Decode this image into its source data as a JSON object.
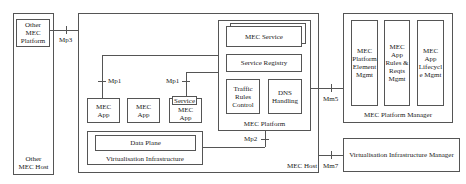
{
  "diagram": {
    "other_host": {
      "label": "Other MEC Host",
      "line1": "Other",
      "line2": "MEC Host",
      "platform": {
        "line1": "Other",
        "line2": "MEC",
        "line3": "Platform"
      }
    },
    "mec_host": {
      "label": "MEC Host",
      "platform": {
        "label": "MEC Platform",
        "service": "MEC Service",
        "registry": "Service Registry",
        "traffic": {
          "line1": "Traffic",
          "line2": "Rules",
          "line3": "Control"
        },
        "dns": {
          "line1": "DNS",
          "line2": "Handling"
        }
      },
      "apps": [
        {
          "line1": "MEC",
          "line2": "App"
        },
        {
          "line1": "MEC",
          "line2": "App"
        },
        {
          "line1": "MEC",
          "line2": "App"
        }
      ],
      "app_service": "Service",
      "virt_infra": {
        "label": "Virtualisation Infrastructure",
        "data_plane": "Data Plane"
      }
    },
    "platform_manager": {
      "label": "MEC Platform Manager",
      "boxes": [
        {
          "lines": [
            "MEC",
            "Platform",
            "Element",
            "Mgmt"
          ]
        },
        {
          "lines": [
            "MEC",
            "App",
            "Rules &",
            "Reqts",
            "Mgmt"
          ]
        },
        {
          "lines": [
            "MEC",
            "App",
            "Lifecycl",
            "e Mgmt"
          ]
        }
      ]
    },
    "vim": {
      "label": "Virtualisation Infrastructure Manager"
    },
    "reference_points": {
      "mp3": "Mp3",
      "mp1_left": "Mp1",
      "mp1_right": "Mp1",
      "mp2": "Mp2",
      "mm5": "Mm5",
      "mm7": "Mm7"
    }
  }
}
